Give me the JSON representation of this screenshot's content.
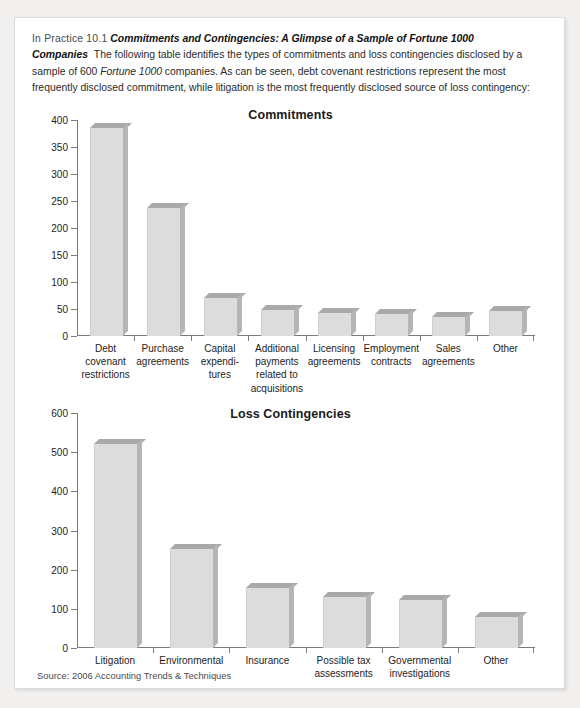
{
  "header": {
    "label": "In Practice 10.1",
    "title": "Commitments and Contingencies: A Glimpse of a Sample of Fortune 1000 Companies",
    "body_part1": "The following table identifies the types of commitments and loss contingencies disclosed by a sample of 600 ",
    "body_em1": "Fortune 1000",
    "body_part2": " companies. As can be seen, debt covenant restrictions represent the most frequently disclosed commitment, while litigation is the most frequently disclosed source of loss contingency:"
  },
  "source_note": "Source: 2006 Accounting Trends & Techniques",
  "colors": {
    "bar_front": "#dcdcdc",
    "bar_top": "#a9a9a9",
    "bar_side": "#b5b5b5",
    "axis": "#7b7b7b",
    "page_background": "#f1f0ee",
    "card_background": "#ffffff"
  },
  "chart_data": [
    {
      "id": "commitments",
      "type": "bar",
      "title": "Commitments",
      "xlabel": "",
      "ylabel": "",
      "ylim": [
        0,
        400
      ],
      "yticks": [
        0,
        50,
        100,
        150,
        200,
        250,
        300,
        350,
        400
      ],
      "grid": false,
      "legend": null,
      "categories": [
        "Debt covenant restrictions",
        "Purchase agreements",
        "Capital expendi-tures",
        "Additional payments related to acquisitions",
        "Licensing agreements",
        "Employment contracts",
        "Sales agreements",
        "Other"
      ],
      "category_lines": [
        [
          "Debt",
          "covenant",
          "restrictions"
        ],
        [
          "Purchase",
          "agreements"
        ],
        [
          "Capital",
          "expendi-",
          "tures"
        ],
        [
          "Additional",
          "payments",
          "related to",
          "acquisitions"
        ],
        [
          "Licensing",
          "agreements"
        ],
        [
          "Employment",
          "contracts"
        ],
        [
          "Sales",
          "agreements"
        ],
        [
          "Other"
        ]
      ],
      "values": [
        385,
        237,
        71,
        49,
        43,
        40,
        36,
        47
      ]
    },
    {
      "id": "loss-contingencies",
      "type": "bar",
      "title": "Loss Contingencies",
      "xlabel": "",
      "ylabel": "",
      "ylim": [
        0,
        600
      ],
      "yticks": [
        0,
        100,
        200,
        300,
        400,
        500,
        600
      ],
      "grid": false,
      "legend": null,
      "categories": [
        "Litigation",
        "Environmental",
        "Insurance",
        "Possible tax assessments",
        "Governmental investigations",
        "Other"
      ],
      "category_lines": [
        [
          "Litigation"
        ],
        [
          "Environmental"
        ],
        [
          "Insurance"
        ],
        [
          "Possible tax",
          "assessments"
        ],
        [
          "Governmental",
          "investigations"
        ],
        [
          "Other"
        ]
      ],
      "values": [
        520,
        253,
        152,
        130,
        122,
        78
      ]
    }
  ]
}
